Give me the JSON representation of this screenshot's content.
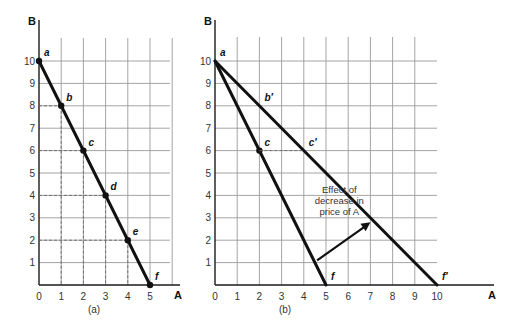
{
  "chart_data": [
    {
      "type": "line",
      "panel": "(a)",
      "caption": "(a)",
      "xlabel": "A",
      "ylabel": "B",
      "xlim": [
        0,
        6
      ],
      "ylim": [
        0,
        10
      ],
      "grid": true,
      "x_ticks": [
        "0",
        "1",
        "2",
        "3",
        "4",
        "5"
      ],
      "y_ticks": [
        "1",
        "2",
        "3",
        "4",
        "5",
        "6",
        "7",
        "8",
        "9",
        "10"
      ],
      "series": [
        {
          "name": "budget line",
          "points": [
            {
              "label": "a",
              "x": 0,
              "y": 10
            },
            {
              "label": "b",
              "x": 1,
              "y": 8
            },
            {
              "label": "c",
              "x": 2,
              "y": 6
            },
            {
              "label": "d",
              "x": 3,
              "y": 4
            },
            {
              "label": "e",
              "x": 4,
              "y": 2
            },
            {
              "label": "f",
              "x": 5,
              "y": 0
            }
          ]
        }
      ]
    },
    {
      "type": "line",
      "panel": "(b)",
      "caption": "(b)",
      "xlabel": "A",
      "ylabel": "B",
      "xlim": [
        0,
        10
      ],
      "ylim": [
        0,
        10
      ],
      "grid": true,
      "x_ticks": [
        "0",
        "1",
        "2",
        "3",
        "4",
        "5",
        "6",
        "7",
        "8",
        "9",
        "10"
      ],
      "y_ticks": [
        "1",
        "2",
        "3",
        "4",
        "5",
        "6",
        "7",
        "8",
        "9",
        "10"
      ],
      "series": [
        {
          "name": "original budget line",
          "points": [
            {
              "label": "a",
              "x": 0,
              "y": 10
            },
            {
              "label": "c",
              "x": 2,
              "y": 6
            },
            {
              "label": "f",
              "x": 5,
              "y": 0
            }
          ]
        },
        {
          "name": "new budget line",
          "points": [
            {
              "label": "a",
              "x": 0,
              "y": 10
            },
            {
              "label": "b′",
              "x": 2,
              "y": 8
            },
            {
              "label": "c′",
              "x": 4,
              "y": 6
            },
            {
              "label": "f′",
              "x": 10,
              "y": 0
            }
          ]
        }
      ],
      "annotation": {
        "lines": [
          "Effect of",
          "decrease in",
          "price of A"
        ],
        "arrow_from": [
          4.6,
          1.1
        ],
        "arrow_to": [
          7.0,
          2.8
        ]
      }
    }
  ]
}
